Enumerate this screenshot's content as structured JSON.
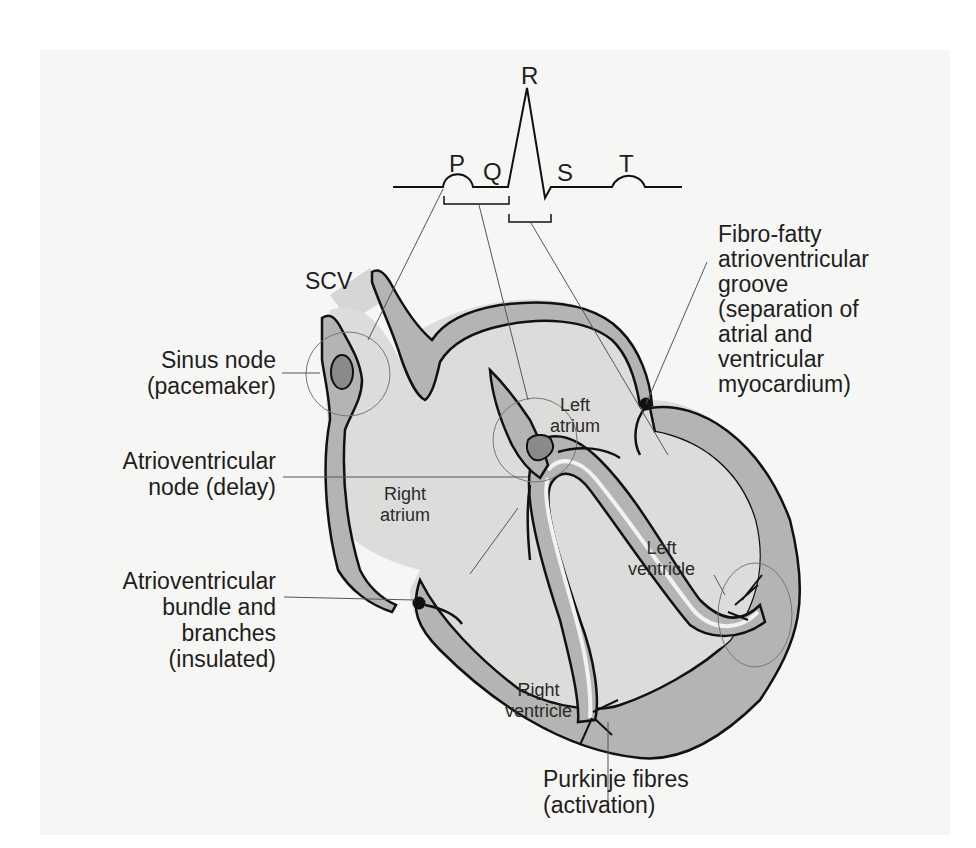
{
  "ecg": {
    "waves": [
      "P",
      "Q",
      "R",
      "S",
      "T"
    ]
  },
  "labels": {
    "scv": "SCV",
    "sinus_node": "Sinus node\n(pacemaker)",
    "av_node": "Atrioventricular\nnode (delay)",
    "av_bundle": "Atrioventricular\nbundle and\nbranches\n(insulated)",
    "fibro_fatty": "Fibro-fatty\natrioventricular\ngroove\n(separation of\natrial and\nventricular\nmyocardium)",
    "purkinje": "Purkinje fibres\n(activation)",
    "right_atrium": "Right\natrium",
    "left_atrium": "Left\natrium",
    "left_ventricle": "Left\nventricle",
    "right_ventricle": "Right\nventricle"
  },
  "colors": {
    "background": "#f6f6f4",
    "chamber_light": "#dcdcda",
    "wall_mid": "#b4b4b2",
    "node_dark": "#8a8a88",
    "outline": "#111111"
  }
}
